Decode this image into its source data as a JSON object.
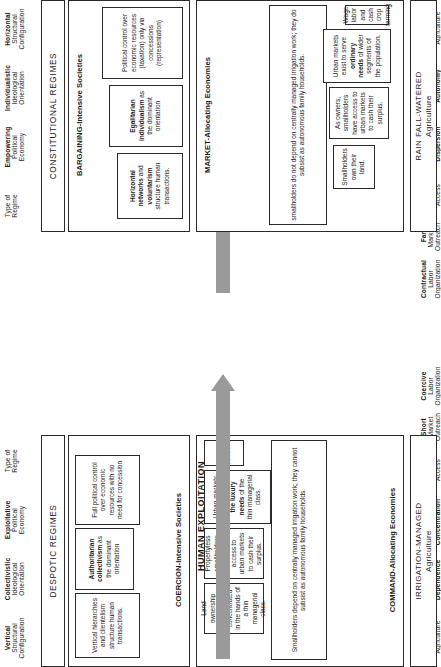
{
  "colors": {
    "arrow_gray": "#9a9a9a",
    "stroke": "#2b2b2b",
    "background": "#ffffff"
  },
  "left_column": {
    "regime_header": "DESPOTIC REGIMES",
    "society_title": "COERCION-Intensive Societies",
    "economy_title": "COMMAND-Allocating Economies",
    "agriculture": {
      "line1": "IRRIGATION-MANAGED",
      "line2": "Agriculture"
    },
    "rails": [
      {
        "l1": "Type of",
        "l2": "Surplus",
        "l3": "Agriculture",
        "bold": false
      },
      {
        "l1": "Subsistence",
        "l2": "Dependence",
        "l3": "",
        "bold": "second"
      },
      {
        "l1": "Land Property",
        "l2": "Concentration",
        "l3": "",
        "bold": "both"
      },
      {
        "l1": "Limited",
        "l2": "Market",
        "l3": "Access",
        "bold": true
      },
      {
        "l1": "Short",
        "l2": "Market",
        "l3": "Outreach",
        "bold": true
      },
      {
        "l1": "Coercive",
        "l2": "Labor",
        "l3": "Organization",
        "bold": true
      },
      {
        "l1": "Vertical",
        "l2": "Structural",
        "l3": "Configuration",
        "bold": true
      },
      {
        "l1": "Collectivistic",
        "l2": "Ideological",
        "l3": "Orientation",
        "bold": true
      },
      {
        "l1": "Exploitative",
        "l2": "Political",
        "l3": "Economy",
        "bold": true
      },
      {
        "l1": "Type of",
        "l2": "Regime",
        "l3": "",
        "bold": false
      }
    ],
    "cells": [
      "Smallholders depend on centrally managed irrigation work; they cannot subsist as autonomous family households.",
      "Land ownership remains concentrated in the hands of a thin managerial class.",
      "Propertyless smallholders have no access to urban markets to cash their surplus.",
      "Urban markets exist to serve the luxury needs of the thin managerial class.",
      "Slavery, serfdom",
      "Vertical hierarchies and clientelism structure human transactions.",
      "Authoritarian collectivism as the dominant orientation",
      "Full political control over economic resources with no need for concession"
    ],
    "cells_bold_fragments": {
      "3": "the luxury needs",
      "6": "Authoritarian collectivism"
    }
  },
  "right_column": {
    "regime_header": "CONSTITUTIONAL REGIMES",
    "society_title": "BARGAINING-Intensive Societies",
    "economy_title": "MARKET-Allocating Economies",
    "agriculture": {
      "line1": "RAIN FALL-WATERED",
      "line2": "Agriculture"
    },
    "rails": [
      {
        "l1": "Type of",
        "l2": "Surplus",
        "l3": "Agriculture",
        "bold": false
      },
      {
        "l1": "Subsistence",
        "l2": "Autonomy",
        "l3": "",
        "bold": "second"
      },
      {
        "l1": "Land Property",
        "l2": "Dispersion",
        "l3": "",
        "bold": "second"
      },
      {
        "l1": "Broad",
        "l2": "Market",
        "l3": "Access",
        "bold": true
      },
      {
        "l1": "Far",
        "l2": "Market",
        "l3": "Outreach",
        "bold": true
      },
      {
        "l1": "Contractual",
        "l2": "Labor",
        "l3": "Organization",
        "bold": true
      },
      {
        "l1": "Horizontal",
        "l2": "Structural",
        "l3": "Configuration",
        "bold": true
      },
      {
        "l1": "Individualistic",
        "l2": "Ideological",
        "l3": "Orientation",
        "bold": true
      },
      {
        "l1": "Empowering",
        "l2": "Political",
        "l3": "Economy",
        "bold": true
      },
      {
        "l1": "Type of",
        "l2": "Regime",
        "l3": "",
        "bold": false
      }
    ],
    "cells": [
      "smallholders do not depend on centrally managed irrigation work; they do subsist as autonomous family households.",
      "Smallholders own their land.",
      "As owners, smallholders have access to urban markets to cash their surplus.",
      "Urban markets exist to serve ordinary needs of wider segments of the population.",
      "Wage labor and cash crop farming",
      "Horizontal networks and voluntarism structure human transactions.",
      "Egalitarian individualism as the dominant orientation",
      "Political control over economic resources (taxation) only via concessions (representation)"
    ],
    "cells_bold_fragments": {
      "3": "ordinary needs",
      "5": "Horizontal networks / voluntarism",
      "6": "Egalitarian individualism"
    }
  },
  "arrows": [
    {
      "label": "HUMAN EXPLOITATION"
    },
    {
      "label": "HUMAN EMANCIPATION"
    }
  ]
}
